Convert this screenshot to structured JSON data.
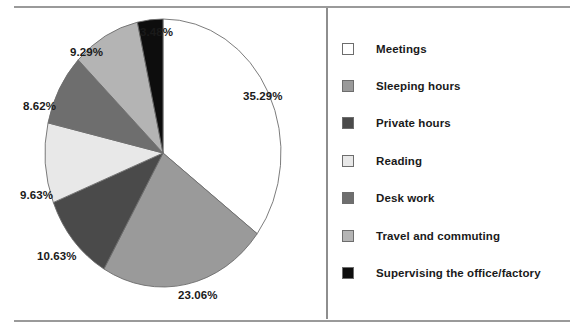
{
  "chart_data": {
    "type": "pie",
    "title": "",
    "subtitle": "",
    "xlabel": "",
    "ylabel": "",
    "legend_position": "right",
    "grid": false,
    "start_angle_deg": 0,
    "direction": "clockwise",
    "categories": [
      "Meetings",
      "Sleeping hours",
      "Private hours",
      "Reading",
      "Desk work",
      "Travel and commuting",
      "Supervising the office/factory"
    ],
    "values": [
      35.29,
      23.06,
      10.63,
      9.63,
      8.62,
      9.29,
      3.48
    ],
    "value_labels": [
      "35.29%",
      "23.06%",
      "10.63%",
      "9.63%",
      "8.62%",
      "9.29%",
      "3.48%"
    ],
    "colors": [
      "#ffffff",
      "#9a9a9a",
      "#4a4a4a",
      "#e8e8e8",
      "#6e6e6e",
      "#b4b4b4",
      "#0d0d0d"
    ],
    "units": "percent",
    "total": 100.0
  },
  "pie": {
    "slices": [
      {
        "label": "Meetings",
        "value": 35.29,
        "value_label": "35.29%",
        "color": "#ffffff",
        "label_x": 243,
        "label_y": 82
      },
      {
        "label": "Sleeping hours",
        "value": 23.06,
        "value_label": "23.06%",
        "color": "#9a9a9a",
        "label_x": 178,
        "label_y": 281
      },
      {
        "label": "Private hours",
        "value": 10.63,
        "value_label": "10.63%",
        "color": "#4a4a4a",
        "label_x": 37,
        "label_y": 242
      },
      {
        "label": "Reading",
        "value": 9.63,
        "value_label": "9.63%",
        "color": "#e8e8e8",
        "label_x": 20,
        "label_y": 181
      },
      {
        "label": "Desk work",
        "value": 8.62,
        "value_label": "8.62%",
        "color": "#6e6e6e",
        "label_x": 23,
        "label_y": 92
      },
      {
        "label": "Travel and commuting",
        "value": 9.29,
        "value_label": "9.29%",
        "color": "#b4b4b4",
        "label_x": 70,
        "label_y": 38
      },
      {
        "label": "Supervising the office/factory",
        "value": 3.48,
        "value_label": "3.48%",
        "color": "#0d0d0d",
        "label_x": 140,
        "label_y": 18
      }
    ],
    "outline_color": "#6d6d6d"
  },
  "legend": {
    "items": [
      {
        "label": "Meetings",
        "color": "#ffffff"
      },
      {
        "label": "Sleeping hours",
        "color": "#9a9a9a"
      },
      {
        "label": "Private hours",
        "color": "#4a4a4a"
      },
      {
        "label": "Reading",
        "color": "#e8e8e8"
      },
      {
        "label": "Desk work",
        "color": "#6e6e6e"
      },
      {
        "label": "Travel and commuting",
        "color": "#b4b4b4"
      },
      {
        "label": "Supervising the office/factory",
        "color": "#0d0d0d"
      }
    ]
  },
  "frame": {
    "rule_color": "#9a9a9a",
    "divider_color": "#8e8e8e"
  }
}
